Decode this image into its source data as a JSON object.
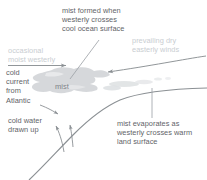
{
  "diagram": {
    "background_color": "#ffffff",
    "text_color_dark": "#5f6468",
    "text_color_faint": "#c9cdd1",
    "mist_color": "#d2d5d8",
    "line_color": "#8b9094",
    "labels": {
      "mist_formed": "mist formed when\nwesterly crosses\ncool ocean surface",
      "prevailing_winds": "prevailing dry\neasterly winds",
      "occasional_westerly": "occasional\nmoist westerly",
      "cold_current": "cold\ncurrent\nfrom\nAtlantic",
      "mist": "mist",
      "cold_water": "cold water\ndrawn up",
      "mist_evaporates": "mist evaporates as\nwesterly crosses warm\nland surface"
    },
    "features": {
      "coastline": "coastline-curve",
      "mist_cloud": "mist-cloud-blob",
      "westerly_arrow": "westerly-wind-arrow",
      "easterly_arrow": "easterly-wind-arrow",
      "current_arrow": "cold-current-arrow",
      "upwelling_arrows": "upwelling-arrows",
      "leader_mist": "leader-line-mist",
      "leader_evaporates": "leader-line-evaporates"
    }
  }
}
